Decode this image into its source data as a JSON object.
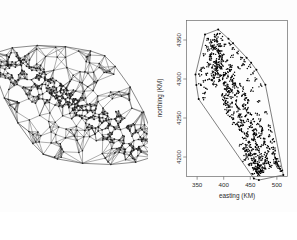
{
  "figure": {
    "panels": [
      {
        "name": "triangulation-panel",
        "kind": "delaunay-triangulation-mesh",
        "has_axes": false,
        "description": "Delaunay triangulation mesh over elongated diagonal region"
      },
      {
        "name": "tessellation-panel",
        "kind": "dirichlet-voronoi-tessellation-scatter",
        "has_axes": true
      }
    ]
  },
  "chart_data": {
    "type": "scatter",
    "title": "",
    "xlabel": "easting (KM)",
    "ylabel": "northing (KM)",
    "xlim": [
      330,
      520
    ],
    "ylim": [
      4175,
      4375
    ],
    "xticks": [
      350,
      400,
      450,
      500
    ],
    "yticks": [
      4200,
      4250,
      4300,
      4350
    ],
    "xticklabels": [
      "350",
      "400",
      "450",
      "500"
    ],
    "yticklabels": [
      "4200",
      "4250",
      "4300",
      "4350"
    ],
    "grid": false,
    "legend": null,
    "overlay": "voronoi-tessellation",
    "point_color": "#000000",
    "cell_edge_color": "#2e2e2e",
    "n_points_approx": 1000,
    "series": [
      {
        "name": "observation sites",
        "x": [
          384,
          381,
          388,
          392,
          379,
          386,
          390,
          383,
          377,
          394,
          387,
          380,
          391,
          385,
          396,
          382,
          389,
          375,
          393,
          386,
          388,
          384,
          397,
          379,
          391,
          386,
          383,
          395,
          380,
          389,
          392,
          377,
          387,
          394,
          382,
          390,
          385,
          398,
          378,
          393,
          386,
          391,
          384,
          396,
          381,
          389,
          394,
          379,
          387,
          392,
          395,
          400,
          404,
          398,
          407,
          402,
          410,
          399,
          406,
          412,
          403,
          408,
          415,
          401,
          409,
          405,
          413,
          397,
          411,
          406,
          414,
          402,
          417,
          408,
          404,
          418,
          410,
          400,
          416,
          407,
          412,
          420,
          405,
          415,
          409,
          422,
          403,
          419,
          413,
          408,
          421,
          411,
          424,
          406,
          417,
          414,
          425,
          409,
          420,
          416,
          428,
          423,
          431,
          426,
          434,
          429,
          437,
          424,
          432,
          439,
          427,
          435,
          441,
          430,
          438,
          433,
          443,
          425,
          440,
          436,
          445,
          431,
          442,
          437,
          428,
          447,
          439,
          434,
          444,
          430,
          448,
          441,
          436,
          450,
          433,
          446,
          443,
          452,
          438,
          449,
          445,
          454,
          440,
          451,
          447,
          456,
          442,
          453,
          458,
          448,
          455,
          460,
          463,
          457,
          466,
          461,
          469,
          458,
          465,
          471,
          459,
          467,
          473,
          462,
          470,
          464,
          475,
          456,
          472,
          468,
          477,
          460,
          474,
          466,
          479,
          463,
          476,
          470,
          481,
          465,
          478,
          472,
          483,
          461,
          480,
          474,
          467,
          482,
          469,
          484,
          471,
          486,
          476,
          462,
          479,
          473,
          488,
          466,
          481,
          477,
          365,
          372,
          358,
          368,
          376,
          362,
          370,
          355,
          366,
          374,
          360,
          369,
          378,
          364,
          371,
          357,
          367,
          375,
          361,
          373,
          490,
          496,
          485,
          493,
          501,
          488,
          497,
          503,
          491,
          499,
          506,
          494,
          502,
          487,
          498,
          508,
          492,
          504,
          495,
          500,
          410,
          418,
          425,
          432,
          440,
          447,
          455,
          462,
          470,
          435,
          395,
          402,
          415,
          428,
          444,
          452,
          466,
          478,
          386,
          392,
          440,
          448,
          455,
          462,
          468,
          458,
          464,
          451,
          445,
          472,
          450,
          457,
          463,
          446,
          460,
          468,
          453,
          442,
          465,
          459,
          455,
          461,
          449,
          467,
          443,
          458,
          464,
          452,
          470,
          447
        ],
        "y": [
          4338,
          4332,
          4344,
          4327,
          4341,
          4350,
          4334,
          4322,
          4347,
          4336,
          4318,
          4343,
          4329,
          4354,
          4325,
          4339,
          4316,
          4331,
          4345,
          4312,
          4335,
          4320,
          4328,
          4308,
          4342,
          4314,
          4348,
          4323,
          4304,
          4337,
          4317,
          4326,
          4310,
          4333,
          4301,
          4321,
          4306,
          4330,
          4315,
          4298,
          4324,
          4302,
          4311,
          4319,
          4295,
          4307,
          4313,
          4299,
          4292,
          4305,
          4316,
          4308,
          4322,
          4301,
          4313,
          4296,
          4318,
          4305,
          4291,
          4310,
          4287,
          4303,
          4315,
          4294,
          4284,
          4307,
          4299,
          4280,
          4311,
          4289,
          4302,
          4276,
          4295,
          4283,
          4272,
          4306,
          4288,
          4268,
          4298,
          4279,
          4264,
          4291,
          4275,
          4284,
          4260,
          4294,
          4271,
          4256,
          4287,
          4267,
          4279,
          4252,
          4290,
          4263,
          4248,
          4275,
          4282,
          4258,
          4244,
          4270,
          4284,
          4272,
          4292,
          4263,
          4278,
          4255,
          4287,
          4266,
          4247,
          4274,
          4259,
          4240,
          4281,
          4251,
          4268,
          4236,
          4276,
          4243,
          4262,
          4232,
          4270,
          4254,
          4228,
          4265,
          4239,
          4257,
          4224,
          4247,
          4261,
          4235,
          4220,
          4252,
          4242,
          4256,
          4216,
          4248,
          4230,
          4244,
          4212,
          4238,
          4226,
          4234,
          4208,
          4240,
          4218,
          4229,
          4204,
          4222,
          4231,
          4214,
          4248,
          4236,
          4254,
          4226,
          4242,
          4218,
          4247,
          4230,
          4212,
          4239,
          4222,
          4206,
          4234,
          4216,
          4228,
          4202,
          4224,
          4210,
          4232,
          4198,
          4220,
          4204,
          4215,
          4226,
          4194,
          4209,
          4218,
          4200,
          4212,
          4190,
          4206,
          4196,
          4208,
          4186,
          4202,
          4192,
          4188,
          4198,
          4184,
          4194,
          4182,
          4190,
          4186,
          4180,
          4196,
          4183,
          4188,
          4178,
          4192,
          4185,
          4332,
          4320,
          4310,
          4342,
          4348,
          4296,
          4336,
          4304,
          4288,
          4326,
          4314,
          4352,
          4340,
          4282,
          4318,
          4292,
          4306,
          4330,
          4276,
          4300,
          4212,
          4200,
          4226,
          4206,
          4192,
          4234,
          4198,
          4188,
          4218,
          4196,
          4184,
          4210,
          4190,
          4240,
          4194,
          4182,
          4222,
          4186,
          4204,
          4193,
          4346,
          4340,
          4334,
          4328,
          4322,
          4316,
          4308,
          4300,
          4292,
          4318,
          4352,
          4344,
          4330,
          4314,
          4298,
          4286,
          4272,
          4258,
          4356,
          4358,
          4196,
          4190,
          4186,
          4182,
          4188,
          4194,
          4184,
          4192,
          4200,
          4180,
          4206,
          4198,
          4192,
          4210,
          4196,
          4188,
          4202,
          4214,
          4190,
          4194,
          4178,
          4184,
          4202,
          4180,
          4208,
          4186,
          4176,
          4198,
          4182,
          4204
        ]
      }
    ]
  },
  "axis": {
    "x_title": "easting (KM)",
    "y_title": "northing (KM)",
    "x_ticks": [
      "350",
      "400",
      "450",
      "500"
    ],
    "y_ticks": [
      "4200",
      "4250",
      "4300",
      "4350"
    ]
  },
  "colors": {
    "background": "#fdfdfd",
    "ink": "#000000",
    "mesh_edge": "#4a4a4a",
    "cell_edge": "#2e2e2e",
    "frame": "#6a6a6a",
    "text": "#2b2b2b"
  }
}
